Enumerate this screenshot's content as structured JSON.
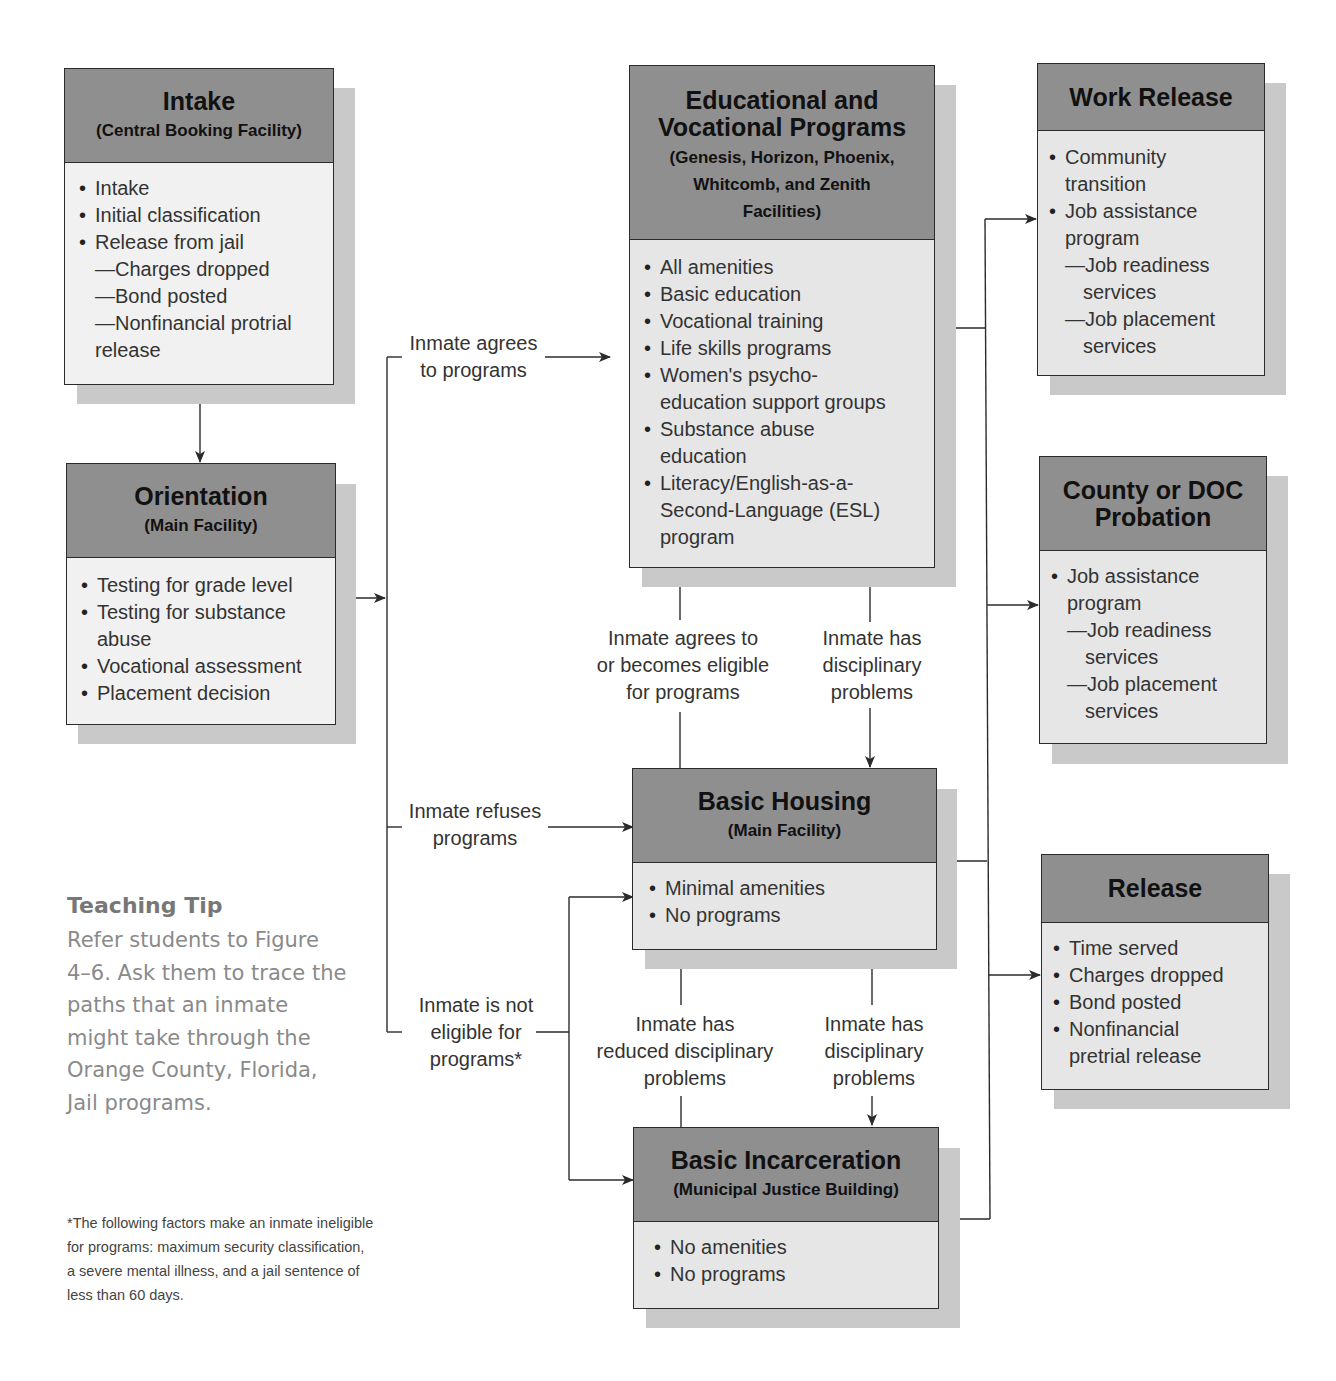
{
  "boxes": {
    "intake": {
      "title": "Intake",
      "subtitle": "(Central Booking Facility)",
      "items": [
        {
          "type": "bullet",
          "text": "Intake"
        },
        {
          "type": "bullet",
          "text": "Initial classification"
        },
        {
          "type": "bullet",
          "text": "Release from jail"
        },
        {
          "type": "dash",
          "text": "—Charges dropped"
        },
        {
          "type": "dash",
          "text": "—Bond posted"
        },
        {
          "type": "dash",
          "text": "—Nonfinancial protrial"
        },
        {
          "type": "cont",
          "text": "release"
        }
      ]
    },
    "orientation": {
      "title": "Orientation",
      "subtitle": "(Main Facility)",
      "items": [
        {
          "type": "bullet",
          "text": "Testing for grade level"
        },
        {
          "type": "bullet",
          "text": "Testing for substance"
        },
        {
          "type": "cont",
          "text": "abuse"
        },
        {
          "type": "bullet",
          "text": "Vocational assessment"
        },
        {
          "type": "bullet",
          "text": "Placement decision"
        }
      ]
    },
    "educational": {
      "title_line1": "Educational and",
      "title_line2": "Vocational Programs",
      "subtitle_line1": "(Genesis, Horizon, Phoenix,",
      "subtitle_line2": "Whitcomb, and Zenith",
      "subtitle_line3": "Facilities)",
      "items": [
        {
          "type": "bullet",
          "text": "All amenities"
        },
        {
          "type": "bullet",
          "text": "Basic education"
        },
        {
          "type": "bullet",
          "text": "Vocational training"
        },
        {
          "type": "bullet",
          "text": "Life skills programs"
        },
        {
          "type": "bullet",
          "text": "Women's psycho-"
        },
        {
          "type": "cont",
          "text": "education support groups"
        },
        {
          "type": "bullet",
          "text": "Substance abuse"
        },
        {
          "type": "cont",
          "text": "education"
        },
        {
          "type": "bullet",
          "text": "Literacy/English-as-a-"
        },
        {
          "type": "cont",
          "text": "Second-Language (ESL)"
        },
        {
          "type": "cont",
          "text": "program"
        }
      ]
    },
    "basic_housing": {
      "title": "Basic Housing",
      "subtitle": "(Main Facility)",
      "items": [
        {
          "type": "bullet",
          "text": "Minimal amenities"
        },
        {
          "type": "bullet",
          "text": "No programs"
        }
      ]
    },
    "basic_incarceration": {
      "title": "Basic Incarceration",
      "subtitle": "(Municipal Justice Building)",
      "items": [
        {
          "type": "bullet",
          "text": "No amenities"
        },
        {
          "type": "bullet",
          "text": "No programs"
        }
      ]
    },
    "work_release": {
      "title": "Work Release",
      "items": [
        {
          "type": "bullet",
          "text": "Community"
        },
        {
          "type": "cont",
          "text": "transition"
        },
        {
          "type": "bullet",
          "text": "Job assistance"
        },
        {
          "type": "cont",
          "text": "program"
        },
        {
          "type": "dash",
          "text": "—Job readiness"
        },
        {
          "type": "cont2",
          "text": "services"
        },
        {
          "type": "dash",
          "text": "—Job placement"
        },
        {
          "type": "cont2",
          "text": "services"
        }
      ]
    },
    "probation": {
      "title_line1": "County or DOC",
      "title_line2": "Probation",
      "items": [
        {
          "type": "bullet",
          "text": "Job assistance"
        },
        {
          "type": "cont",
          "text": "program"
        },
        {
          "type": "dash",
          "text": "—Job readiness"
        },
        {
          "type": "cont2",
          "text": "services"
        },
        {
          "type": "dash",
          "text": "—Job placement"
        },
        {
          "type": "cont2",
          "text": "services"
        }
      ]
    },
    "release": {
      "title": "Release",
      "items": [
        {
          "type": "bullet",
          "text": "Time served"
        },
        {
          "type": "bullet",
          "text": "Charges dropped"
        },
        {
          "type": "bullet",
          "text": "Bond posted"
        },
        {
          "type": "bullet",
          "text": "Nonfinancial"
        },
        {
          "type": "cont",
          "text": "pretrial release"
        }
      ]
    }
  },
  "labels": {
    "agrees": [
      "Inmate agrees",
      "to programs"
    ],
    "refuses": [
      "Inmate refuses",
      "programs"
    ],
    "not_eligible": [
      "Inmate is not",
      "eligible for",
      "programs*"
    ],
    "becomes_eligible": [
      "Inmate agrees to",
      "or becomes eligible",
      "for programs"
    ],
    "disciplinary_upper": [
      "Inmate has",
      "disciplinary",
      "problems"
    ],
    "reduced_disciplinary": [
      "Inmate has",
      "reduced disciplinary",
      "problems"
    ],
    "disciplinary_lower": [
      "Inmate has",
      "disciplinary",
      "problems"
    ]
  },
  "teaching_tip": {
    "title": "Teaching Tip",
    "lines": [
      "Refer students to Figure",
      "4–6. Ask them to trace the",
      "paths that an inmate",
      "might take through the",
      "Orange County, Florida,",
      "Jail programs."
    ]
  },
  "footnote": {
    "lines": [
      "*The following factors make an inmate ineligible",
      "for programs: maximum security classification,",
      "a severe mental illness, and a jail sentence of",
      "less than 60 days."
    ]
  },
  "colors": {
    "header_fill": "#8f8f8f",
    "body_fill": "#e6e6e6",
    "shadow": "#c9c9c9",
    "line": "#2b2b2b",
    "tip_text": "#8a8a8a"
  }
}
